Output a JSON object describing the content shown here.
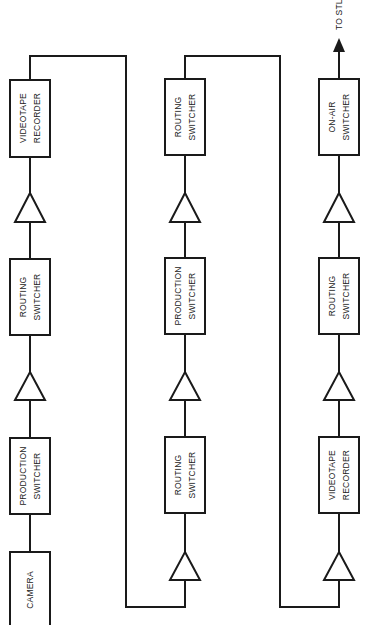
{
  "diagram": {
    "type": "signal-flow",
    "orientation": "rotated-90-ccw",
    "output_label": "TO STL",
    "columns": [
      {
        "id": "col1",
        "blocks": [
          {
            "kind": "box",
            "name": "camera",
            "lines": [
              "CAMERA"
            ]
          },
          {
            "kind": "box",
            "name": "production-switcher",
            "lines": [
              "PRODUCTION",
              "SWITCHER"
            ]
          },
          {
            "kind": "amplifier"
          },
          {
            "kind": "box",
            "name": "routing-switcher",
            "lines": [
              "ROUTING",
              "SWITCHER"
            ]
          },
          {
            "kind": "amplifier"
          },
          {
            "kind": "box",
            "name": "videotape-recorder",
            "lines": [
              "VIDEOTAPE",
              "RECORDER"
            ]
          }
        ]
      },
      {
        "id": "col2",
        "blocks": [
          {
            "kind": "amplifier"
          },
          {
            "kind": "box",
            "name": "routing-switcher",
            "lines": [
              "ROUTING",
              "SWITCHER"
            ]
          },
          {
            "kind": "amplifier"
          },
          {
            "kind": "box",
            "name": "production-switcher",
            "lines": [
              "PRODUCTION",
              "SWITCHER"
            ]
          },
          {
            "kind": "amplifier"
          },
          {
            "kind": "box",
            "name": "routing-switcher",
            "lines": [
              "ROUTING",
              "SWITCHER"
            ]
          }
        ]
      },
      {
        "id": "col3",
        "blocks": [
          {
            "kind": "amplifier"
          },
          {
            "kind": "box",
            "name": "videotape-recorder",
            "lines": [
              "VIDEOTAPE",
              "RECORDER"
            ]
          },
          {
            "kind": "amplifier"
          },
          {
            "kind": "box",
            "name": "routing-switcher",
            "lines": [
              "ROUTING",
              "SWITCHER"
            ]
          },
          {
            "kind": "amplifier"
          },
          {
            "kind": "box",
            "name": "on-air-switcher",
            "lines": [
              "ON-AIR",
              "SWITCHER"
            ]
          }
        ]
      }
    ]
  },
  "labels": {
    "c1_camera": "CAMERA",
    "c1_prod_1": "PRODUCTION",
    "c1_prod_2": "SWITCHER",
    "c1_route_1": "ROUTING",
    "c1_route_2": "SWITCHER",
    "c1_vtr_1": "VIDEOTAPE",
    "c1_vtr_2": "RECORDER",
    "c2_route_a_1": "ROUTING",
    "c2_route_a_2": "SWITCHER",
    "c2_prod_1": "PRODUCTION",
    "c2_prod_2": "SWITCHER",
    "c2_route_b_1": "ROUTING",
    "c2_route_b_2": "SWITCHER",
    "c3_vtr_1": "VIDEOTAPE",
    "c3_vtr_2": "RECORDER",
    "c3_route_1": "ROUTING",
    "c3_route_2": "SWITCHER",
    "c3_onair_1": "ON-AIR",
    "c3_onair_2": "SWITCHER",
    "to_stl": "TO STL"
  },
  "colors": {
    "stroke": "#1a1a1a",
    "background": "#ffffff"
  }
}
